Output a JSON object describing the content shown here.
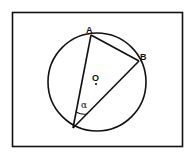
{
  "diagram": {
    "type": "inscribed-angle",
    "frame": {
      "x": 12,
      "y": 12,
      "width": 171,
      "height": 135
    },
    "circle": {
      "cx": 97,
      "cy": 82,
      "r": 49
    },
    "center": {
      "label": "O",
      "x": 96,
      "y": 84
    },
    "points": {
      "A": {
        "label": "A",
        "x": 91,
        "y": 35
      },
      "B": {
        "label": "B",
        "x": 139,
        "y": 61
      },
      "C": {
        "label": "",
        "x": 73,
        "y": 128
      }
    },
    "angle": {
      "label": "α",
      "vertex": "C"
    },
    "colors": {
      "stroke": "#111111",
      "background": "#ffffff"
    }
  }
}
